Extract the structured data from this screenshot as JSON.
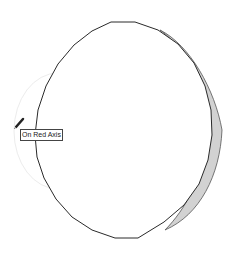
{
  "viewport": {
    "tool": "pencil",
    "inference_tooltip": "On Red Axis",
    "colors": {
      "edge": "#2a2a2a",
      "side_face": "#c8c8c8",
      "guide_circle": "#e6e6e6",
      "background": "#ffffff"
    }
  }
}
